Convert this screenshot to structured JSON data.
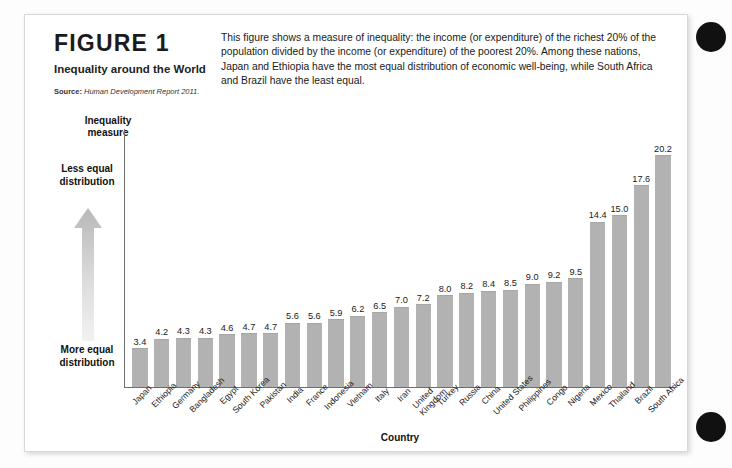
{
  "figure": {
    "label": "FIGURE 1",
    "title": "Inequality around the World",
    "source_label": "Source:",
    "source_text": "Human Development Report 2011.",
    "description": "This figure shows a measure of inequality: the income (or expenditure) of the richest 20% of the population divided by the income (or expenditure) of the poorest 20%. Among these nations, Japan and Ethiopia have the most equal distribution of economic well-being, while South Africa and Brazil have the least equal."
  },
  "legend": {
    "less_equal": "Less\nequal\ndistribution",
    "more_equal": "More\nequal\ndistribution",
    "arrow_icon": "up-arrow-gradient-icon"
  },
  "colors": {
    "bar_fill": "#b2b2b2",
    "axis_line": "#6e6e6e",
    "card_bg": "#ffffff",
    "page_bg": "#fdfdfd",
    "binding_dot": "#111111",
    "text": "#1a1a1a"
  },
  "chart_data": {
    "type": "bar",
    "title": "Inequality around the World",
    "xlabel": "Country",
    "ylabel": "Inequality measure",
    "ylim": [
      0,
      22.5
    ],
    "grid": false,
    "legend_position": "none",
    "categories": [
      "Japan",
      "Ethiopia",
      "Germany",
      "Bangladesh",
      "Egypt",
      "South Korea",
      "Pakistan",
      "India",
      "France",
      "Indonesia",
      "Vietnam",
      "Italy",
      "Iran",
      "United\nKingdom",
      "Turkey",
      "Russia",
      "China",
      "United States",
      "Philippines",
      "Congo",
      "Nigeria",
      "Mexico",
      "Thailand",
      "Brazil",
      "South Africa"
    ],
    "values": [
      3.4,
      4.2,
      4.3,
      4.3,
      4.6,
      4.7,
      4.7,
      5.6,
      5.6,
      5.9,
      6.2,
      6.5,
      7.0,
      7.2,
      8.0,
      8.2,
      8.4,
      8.5,
      9.0,
      9.2,
      9.5,
      14.4,
      15.0,
      17.6,
      20.2
    ],
    "value_labels": [
      "3.4",
      "4.2",
      "4.3",
      "4.3",
      "4.6",
      "4.7",
      "4.7",
      "5.6",
      "5.6",
      "5.9",
      "6.2",
      "6.5",
      "7.0",
      "7.2",
      "8.0",
      "8.2",
      "8.4",
      "8.5",
      "9.0",
      "9.2",
      "9.5",
      "14.4",
      "15.0",
      "17.6",
      "20.2"
    ]
  }
}
